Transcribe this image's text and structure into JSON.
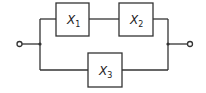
{
  "diagram": {
    "type": "series-parallel block diagram",
    "blocks": [
      {
        "id": "X1",
        "var": "X",
        "sub": "1"
      },
      {
        "id": "X2",
        "var": "X",
        "sub": "2"
      },
      {
        "id": "X3",
        "var": "X",
        "sub": "3"
      }
    ],
    "connections": [
      "input -> X1 -> X2 -> output",
      "input -> X3 -> output"
    ],
    "colors": {
      "line": "#333333",
      "background": "#ffffff"
    }
  }
}
